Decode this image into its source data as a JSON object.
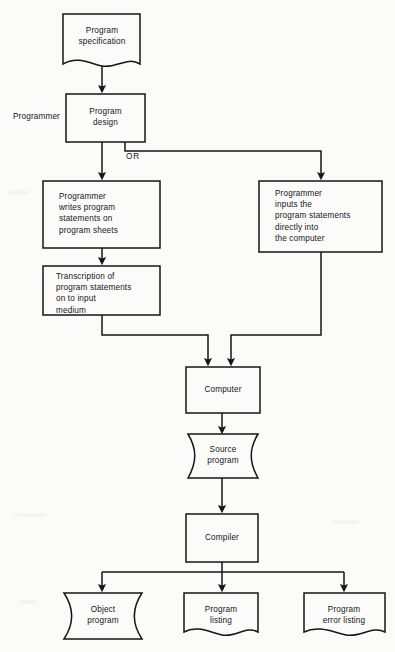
{
  "diagram": {
    "type": "flowchart",
    "side_labels": [
      {
        "id": "programmer-role",
        "text": "Programmer"
      }
    ],
    "connector_labels": [
      {
        "id": "or-branch",
        "text": "OR"
      }
    ],
    "nodes": [
      {
        "id": "program-specification",
        "shape": "document",
        "text": "Program\nspecification"
      },
      {
        "id": "program-design",
        "shape": "rectangle",
        "text": "Program\ndesign"
      },
      {
        "id": "programmer-writes",
        "shape": "rectangle",
        "text": "Programmer\nwrites program\nstatements on\nprogram sheets"
      },
      {
        "id": "programmer-inputs",
        "shape": "rectangle",
        "text": "Programmer\ninputs the\nprogram statements\ndirectly into\nthe computer"
      },
      {
        "id": "transcription",
        "shape": "rectangle",
        "text": "Transcription of\nprogram statements\non to input\nmedium"
      },
      {
        "id": "computer",
        "shape": "rectangle",
        "text": "Computer"
      },
      {
        "id": "source-program",
        "shape": "punched-tape",
        "text": "Source\nprogram"
      },
      {
        "id": "compiler",
        "shape": "rectangle",
        "text": "Compiler"
      },
      {
        "id": "object-program",
        "shape": "punched-tape",
        "text": "Object\nprogram"
      },
      {
        "id": "program-listing",
        "shape": "document",
        "text": "Program\nlisting"
      },
      {
        "id": "program-error-listing",
        "shape": "document",
        "text": "Program\nerror listing"
      }
    ],
    "edges": [
      {
        "from": "program-specification",
        "to": "program-design"
      },
      {
        "from": "program-design",
        "to": "programmer-writes"
      },
      {
        "from": "program-design",
        "to": "programmer-inputs",
        "label": "OR"
      },
      {
        "from": "programmer-writes",
        "to": "transcription"
      },
      {
        "from": "transcription",
        "to": "computer"
      },
      {
        "from": "programmer-inputs",
        "to": "computer"
      },
      {
        "from": "computer",
        "to": "source-program"
      },
      {
        "from": "source-program",
        "to": "compiler"
      },
      {
        "from": "compiler",
        "to": "object-program"
      },
      {
        "from": "compiler",
        "to": "program-listing"
      },
      {
        "from": "compiler",
        "to": "program-error-listing"
      }
    ],
    "colors": {
      "stroke": "#16161a",
      "text": "#16161a",
      "background": "#fbfbf9"
    }
  }
}
